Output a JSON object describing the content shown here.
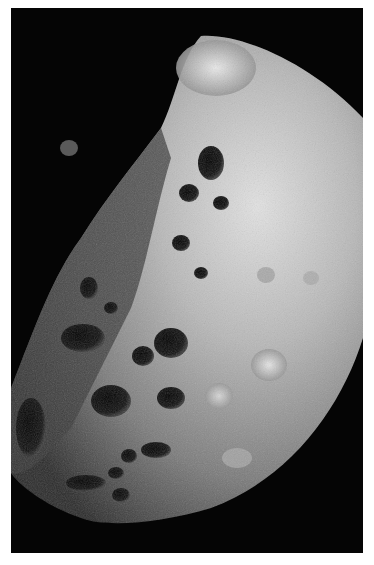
{
  "image": {
    "subject": "cratered moon surface",
    "style": "grayscale space photograph",
    "background_color": "#050505",
    "border_color": "#ffffff"
  }
}
